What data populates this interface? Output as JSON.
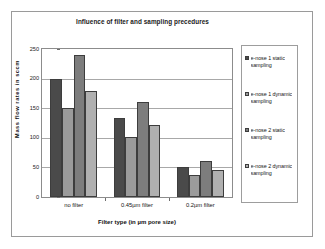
{
  "chart_data": {
    "type": "bar",
    "title": "Influence of filter and sampling precedures",
    "xlabel": "Filter type (in µm pore size)",
    "ylabel": "Mass flow rates  in sccm",
    "categories": [
      "no filter",
      "0.45µm filter",
      "0.2µm filter"
    ],
    "ylim": [
      0,
      250
    ],
    "yticks": [
      0,
      50,
      100,
      150,
      200,
      250
    ],
    "grid": true,
    "legend_position": "right",
    "series": [
      {
        "name": "e-nose 1 static sampling",
        "color": "#4a4a4a",
        "values": [
          200,
          134,
          50
        ]
      },
      {
        "name": "e-nose 1 dynamic sampling",
        "color": "#9b9b9b",
        "values": [
          150,
          101,
          38
        ]
      },
      {
        "name": "e-nose 2 static sampling",
        "color": "#7d7d7d",
        "values": [
          240,
          161,
          60
        ]
      },
      {
        "name": "e-nose 2 dynamic sampling",
        "color": "#b0b0b0",
        "values": [
          179,
          122,
          45
        ]
      }
    ]
  },
  "legend": {
    "items": [
      {
        "label": "e-nose 1 static sampling"
      },
      {
        "label": "e-nose 1 dynamic sampling"
      },
      {
        "label": "e-nose 2 static sampling"
      },
      {
        "label": "e-nose 2 dynamic sampling"
      }
    ]
  }
}
